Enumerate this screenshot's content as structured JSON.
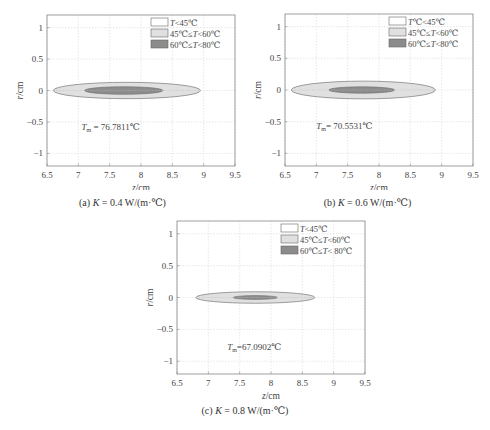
{
  "chart_data": [
    {
      "id": "a",
      "type": "contour",
      "caption_prefix": "(a) ",
      "caption_var": "K",
      "caption_rest": " = 0.4 W/(m·℃)",
      "xlabel": "z/cm",
      "ylabel": "r/cm",
      "xlim": [
        6.5,
        9.5
      ],
      "ylim": [
        -1.2,
        1.2
      ],
      "xticks": [
        "6.5",
        "7",
        "7.5",
        "8",
        "8.5",
        "9",
        "9.5"
      ],
      "yticks": [
        "1",
        "0.5",
        "0",
        "-0.5",
        "-1"
      ],
      "grid": true,
      "legend": [
        {
          "label": "T<45℃",
          "color": "#ffffff"
        },
        {
          "label": "45℃≤T<60℃",
          "color": "#e0e0e0"
        },
        {
          "label": "60℃≤T<80℃",
          "color": "#8c8c8c"
        }
      ],
      "legend_position": "upper right",
      "regions": [
        {
          "name": "45℃≤T<60℃",
          "z_min": 6.6,
          "z_max": 8.95,
          "r_half": 0.13
        },
        {
          "name": "60℃≤T<80℃",
          "z_min": 7.1,
          "z_max": 8.35,
          "r_half": 0.06
        }
      ],
      "annotation": {
        "label": "T",
        "sub": "m",
        "value": " = 76.7811℃",
        "z": 7.05,
        "r": -0.62
      }
    },
    {
      "id": "b",
      "type": "contour",
      "caption_prefix": "(b) ",
      "caption_var": "K",
      "caption_rest": " = 0.6 W/(m·℃)",
      "xlabel": "z/cm",
      "ylabel": "r/cm",
      "xlim": [
        6.5,
        9.5
      ],
      "ylim": [
        -1.2,
        1.2
      ],
      "xticks": [
        "6.5",
        "7",
        "7.5",
        "8",
        "8.5",
        "9",
        "9.5"
      ],
      "yticks": [
        "1",
        "0.5",
        "0",
        "-0.5",
        "-1"
      ],
      "grid": true,
      "legend": [
        {
          "label": "T℃<45℃",
          "color": "#ffffff"
        },
        {
          "label": "45℃≤T<60℃",
          "color": "#e0e0e0"
        },
        {
          "label": "60℃≤T<80℃",
          "color": "#8c8c8c"
        }
      ],
      "legend_position": "upper right",
      "regions": [
        {
          "name": "45℃≤T<60℃",
          "z_min": 6.6,
          "z_max": 8.9,
          "r_half": 0.14
        },
        {
          "name": "60℃≤T<80℃",
          "z_min": 7.2,
          "z_max": 8.25,
          "r_half": 0.05
        }
      ],
      "annotation": {
        "label": "T",
        "sub": "m",
        "value": "= 70.5531℃",
        "z": 7.0,
        "r": -0.62
      }
    },
    {
      "id": "c",
      "type": "contour",
      "caption_prefix": "(c) ",
      "caption_var": "K",
      "caption_rest": " = 0.8 W/(m·℃)",
      "xlabel": "z/cm",
      "ylabel": "r/cm",
      "xlim": [
        6.5,
        9.5
      ],
      "ylim": [
        -1.2,
        1.2
      ],
      "xticks": [
        "6.5",
        "7",
        "7.5",
        "8",
        "8.5",
        "9",
        "9.5"
      ],
      "yticks": [
        "1",
        "0.5",
        "0",
        "-0.5",
        "-1"
      ],
      "grid": true,
      "legend": [
        {
          "label": "T<45℃",
          "color": "#ffffff"
        },
        {
          "label": "45℃≤T<60℃",
          "color": "#e0e0e0"
        },
        {
          "label": "60℃≤T< 80℃",
          "color": "#8c8c8c"
        }
      ],
      "legend_position": "upper right",
      "regions": [
        {
          "name": "45℃≤T<60℃",
          "z_min": 6.8,
          "z_max": 8.7,
          "r_half": 0.09
        },
        {
          "name": "60℃≤T<80℃",
          "z_min": 7.4,
          "z_max": 8.1,
          "r_half": 0.03
        }
      ],
      "annotation": {
        "label": "T",
        "sub": "m",
        "value": "=67.0902℃",
        "z": 7.3,
        "r": -0.82
      }
    }
  ]
}
